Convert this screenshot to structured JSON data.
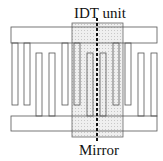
{
  "labels": {
    "top": "IDT unit",
    "bottom": "Mirror"
  },
  "colors": {
    "stroke": "#555555",
    "shade": "#e4e4e4",
    "mirror_line": "#111111"
  },
  "geometry": {
    "top_bus": {
      "x": 11,
      "y": 27,
      "w": 146,
      "h": 16
    },
    "bottom_bus": {
      "x": 11,
      "y": 116,
      "w": 146,
      "h": 15
    },
    "unit_region": {
      "x": 72,
      "y": 23,
      "w": 51,
      "h": 114
    },
    "mirror_x": 97,
    "top_fingers_x": [
      12,
      24,
      62,
      74,
      113,
      125
    ],
    "bottom_fingers_x": [
      36,
      49,
      87,
      100,
      138,
      151
    ]
  }
}
